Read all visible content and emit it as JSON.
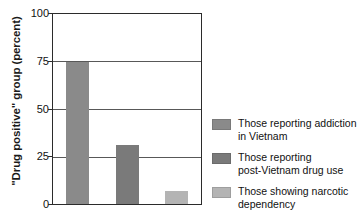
{
  "chart_data": {
    "type": "bar",
    "title": "",
    "xlabel": "",
    "ylabel": "\"Drug positive\" group (percent)",
    "ylim": [
      0,
      100
    ],
    "yticks": [
      0,
      25,
      50,
      75,
      100
    ],
    "ytick_labels": [
      "0",
      "25",
      "50",
      "75",
      "100"
    ],
    "grid": "horizontal",
    "legend_position": "right",
    "categories": [
      "Those reporting addiction in Vietnam",
      "Those reporting post-Vietnam drug use",
      "Those showing narcotic dependency"
    ],
    "values": [
      75,
      31,
      7
    ],
    "bars": [
      {
        "label": "Those reporting addiction\nin Vietnam",
        "value": 75,
        "color": "#8a8a8a"
      },
      {
        "label": "Those reporting\npost-Vietnam drug use",
        "value": 31,
        "color": "#7a7a7a"
      },
      {
        "label": "Those showing narcotic\ndependency",
        "value": 7,
        "color": "#b4b4b4"
      }
    ]
  },
  "axis": {
    "y_title": "\"Drug positive\" group (percent)",
    "tick_100": "100",
    "tick_75": "75",
    "tick_50": "50",
    "tick_25": "25",
    "tick_0": "0"
  },
  "legend": {
    "entries": [
      {
        "label": "Those reporting addiction\nin Vietnam",
        "color": "#8a8a8a"
      },
      {
        "label": "Those reporting\npost-Vietnam drug use",
        "color": "#7a7a7a"
      },
      {
        "label": "Those showing narcotic\ndependency",
        "color": "#b4b4b4"
      }
    ]
  }
}
